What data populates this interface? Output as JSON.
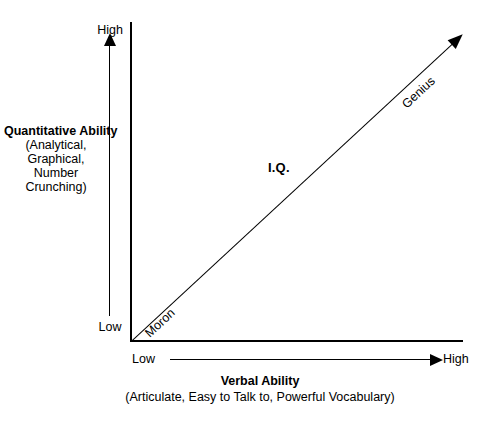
{
  "chart_data": {
    "type": "line",
    "title": "",
    "xlabel": "Verbal Ability",
    "xlabel_sub": "(Articulate, Easy to Talk to, Powerful Vocabulary)",
    "ylabel": "Quantitative Ability",
    "ylabel_sub": "(Analytical, Graphical, Number Crunching)",
    "x_ticks": [
      "Low",
      "High"
    ],
    "y_ticks": [
      "Low",
      "High"
    ],
    "xlim": [
      "Low",
      "High"
    ],
    "ylim": [
      "Low",
      "High"
    ],
    "grid": false,
    "legend": "none",
    "series": [
      {
        "name": "I.Q.",
        "x": [
          "Low",
          "High"
        ],
        "values": [
          "Low",
          "High"
        ],
        "start_annotation": "Moron",
        "end_annotation": "Genius"
      }
    ],
    "annotations": [
      {
        "text": "I.Q.",
        "position": "center-above-line",
        "bold": true
      },
      {
        "text": "Moron",
        "position": "lower-left-along-line",
        "rotated": true
      },
      {
        "text": "Genius",
        "position": "upper-right-along-line",
        "rotated": true
      },
      {
        "text": "High",
        "position": "y-axis-top"
      },
      {
        "text": "Low",
        "position": "y-axis-bottom"
      },
      {
        "text": "Low",
        "position": "x-axis-left"
      },
      {
        "text": "High",
        "position": "x-axis-right"
      }
    ]
  },
  "axes": {
    "y": {
      "title": "Quantitative Ability",
      "title_sub_lines": [
        "(Analytical,",
        "Graphical,",
        "Number",
        "Crunching)"
      ],
      "title_sub": "(Analytical, Graphical, Number Crunching)",
      "high_label": "High",
      "low_label": "Low"
    },
    "x": {
      "title": "Verbal Ability",
      "title_sub": "(Articulate, Easy to Talk to, Powerful Vocabulary)",
      "high_label": "High",
      "low_label": "Low"
    }
  },
  "line": {
    "label": "I.Q.",
    "low_end_label": "Moron",
    "high_end_label": "Genius"
  },
  "colors": {
    "background": "#ffffff",
    "ink": "#000000"
  }
}
